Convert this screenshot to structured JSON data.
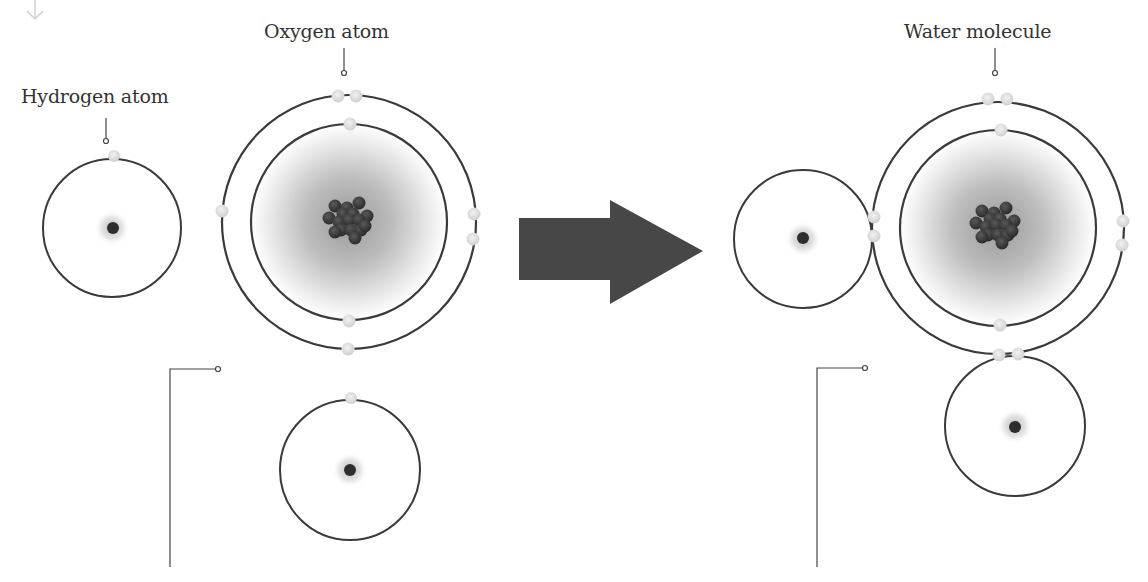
{
  "diagram": {
    "labels": {
      "hydrogen_atom": "Hydrogen atom",
      "oxygen_atom": "Oxygen atom",
      "water_molecule": "Water molecule"
    },
    "icons": {
      "scroll_hint": "down-arrow-icon",
      "reaction_arrow": "right-arrow-icon"
    },
    "colors": {
      "orbit": "#3a3a3a",
      "nucleus": "#2e2e2e",
      "electron": "#d9d9d9",
      "arrow": "#474747",
      "text": "#333333",
      "leader_line": "#444444"
    },
    "reactants": {
      "hydrogen_1": {
        "cx": 112,
        "cy": 228,
        "r": 69,
        "electrons": [
          [
            114,
            156
          ]
        ]
      },
      "hydrogen_2": {
        "cx": 350,
        "cy": 470,
        "r": 70,
        "electrons": [
          [
            351,
            398
          ]
        ]
      },
      "oxygen": {
        "cx": 349,
        "cy": 222,
        "inner_r": 98,
        "outer_r": 127,
        "protons_neutrons": 16,
        "inner_electrons": [
          [
            350,
            124
          ],
          [
            349,
            321
          ]
        ],
        "outer_electrons": [
          [
            338,
            96
          ],
          [
            356,
            96
          ],
          [
            222,
            211
          ],
          [
            474,
            214
          ],
          [
            473,
            239
          ],
          [
            348,
            349
          ]
        ]
      }
    },
    "product": {
      "oxygen": {
        "cx": 998,
        "cy": 228,
        "inner_r": 98,
        "outer_r": 126,
        "protons_neutrons": 16,
        "inner_electrons": [
          [
            1001,
            130
          ],
          [
            1000,
            325
          ]
        ],
        "outer_electrons": [
          [
            988,
            99
          ],
          [
            1007,
            99
          ],
          [
            1123,
            221
          ],
          [
            1122,
            245
          ]
        ]
      },
      "hydrogen_left": {
        "cx": 803,
        "cy": 239,
        "r": 69,
        "shared_electrons": [
          [
            874,
            217
          ],
          [
            874,
            236
          ]
        ]
      },
      "hydrogen_bottom": {
        "cx": 1015,
        "cy": 426,
        "r": 70,
        "shared_electrons": [
          [
            999,
            355
          ],
          [
            1018,
            354
          ]
        ]
      }
    }
  }
}
